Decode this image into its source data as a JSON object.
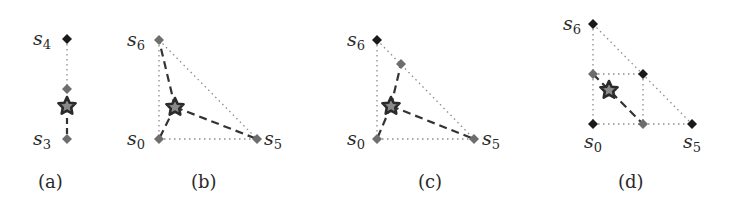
{
  "colors": {
    "vertex_dark": "#1a1a1a",
    "vertex_gray": "#6e6e6e",
    "star_fill": "#8a8a8a",
    "star_stroke": "#2b2b2b",
    "dotted": "#8c8c8c",
    "dashed": "#333333",
    "text": "#2a2a2a"
  },
  "panels": [
    {
      "caption": "(a)",
      "labels": [
        {
          "base": "s",
          "sub": "4"
        },
        {
          "base": "s",
          "sub": "3"
        }
      ]
    },
    {
      "caption": "(b)",
      "labels": [
        {
          "base": "s",
          "sub": "6"
        },
        {
          "base": "s",
          "sub": "0"
        },
        {
          "base": "s",
          "sub": "5"
        }
      ]
    },
    {
      "caption": "(c)",
      "labels": [
        {
          "base": "s",
          "sub": "6"
        },
        {
          "base": "s",
          "sub": "0"
        },
        {
          "base": "s",
          "sub": "5"
        }
      ]
    },
    {
      "caption": "(d)",
      "labels": [
        {
          "base": "s",
          "sub": "6"
        },
        {
          "base": "s",
          "sub": "0"
        },
        {
          "base": "s",
          "sub": "5"
        }
      ]
    }
  ]
}
